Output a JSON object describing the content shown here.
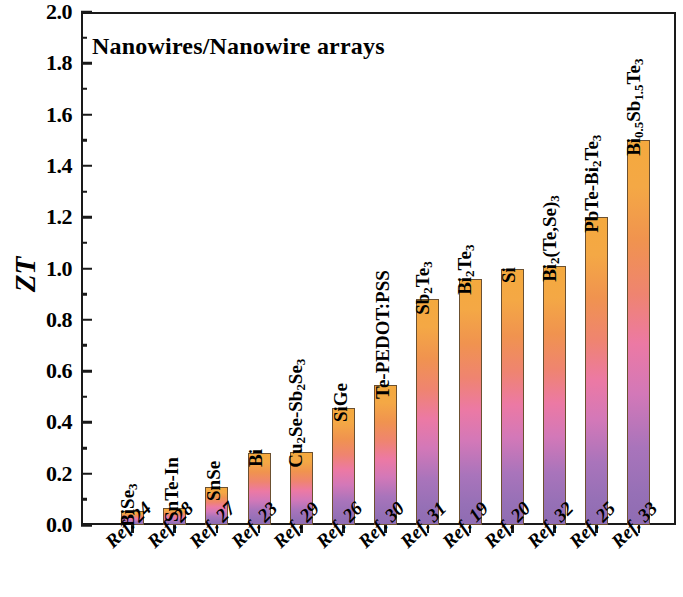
{
  "chart_data": {
    "type": "bar",
    "title": "Nanowires/Nanowire arrays",
    "xlabel": "",
    "ylabel": "ZT",
    "ylim": [
      0.0,
      2.0
    ],
    "ytick_step": 0.2,
    "yminor_step": 0.1,
    "grid": false,
    "legend": null,
    "categories": [
      "Ref. 24",
      "Ref. 28",
      "Ref. 27",
      "Ref. 23",
      "Ref. 29",
      "Ref. 26",
      "Ref. 30",
      "Ref. 31",
      "Ref. 19",
      "Ref. 20",
      "Ref. 32",
      "Ref. 25",
      "Ref. 33"
    ],
    "values": [
      0.055,
      0.065,
      0.15,
      0.28,
      0.285,
      0.455,
      0.545,
      0.88,
      0.96,
      1.0,
      1.01,
      1.2,
      1.5
    ],
    "point_labels": [
      "BiSe3",
      "SnTe-In",
      "SnSe",
      "Bi",
      "Cu2Se-Sb2Se3",
      "SiGe",
      "Te-PEDOT:PSS",
      "Sb2Te3",
      "Bi2Te3",
      "Si",
      "Bi2(Te,Se)3",
      "PbTe-Bi2Te3",
      "Bi0.5Sb1.5Te3"
    ],
    "point_labels_html": [
      "BiSe<sub>3</sub>",
      "SnTe-In",
      "SnSe",
      "Bi",
      "Cu<sub>2</sub>Se-Sb<sub>2</sub>Se<sub>3</sub>",
      "SiGe",
      "Te-PEDOT:PSS",
      "Sb<sub>2</sub>Te<sub>3</sub>",
      "Bi<sub>2</sub>Te<sub>3</sub>",
      "Si",
      "Bi<sub>2</sub>(Te,Se)<sub>3</sub>",
      "PbTe-Bi<sub>2</sub>Te<sub>3</sub>",
      "Bi<sub>0.5</sub>Sb<sub>1.5</sub>Te<sub>3</sub>"
    ],
    "ytick_labels": [
      "2.0",
      "1.8",
      "1.6",
      "1.4",
      "1.2",
      "1.0",
      "0.8",
      "0.6",
      "0.4",
      "0.2",
      "0.0"
    ],
    "ytick_values": [
      2.0,
      1.8,
      1.6,
      1.4,
      1.2,
      1.0,
      0.8,
      0.6,
      0.4,
      0.2,
      0.0
    ],
    "yminor_values": [
      1.9,
      1.7,
      1.5,
      1.3,
      1.1,
      0.9,
      0.7,
      0.5,
      0.3,
      0.1
    ],
    "bar_gradient": {
      "top": "#f4a93e",
      "mid_upper": "#ef8470",
      "mid": "#ec79a4",
      "mid_lower": "#a974bb",
      "bottom": "#8f6cb2"
    },
    "bar_edge_color": "#6b5030",
    "axis_color": "#1a1a1a",
    "background": "#ffffff"
  }
}
